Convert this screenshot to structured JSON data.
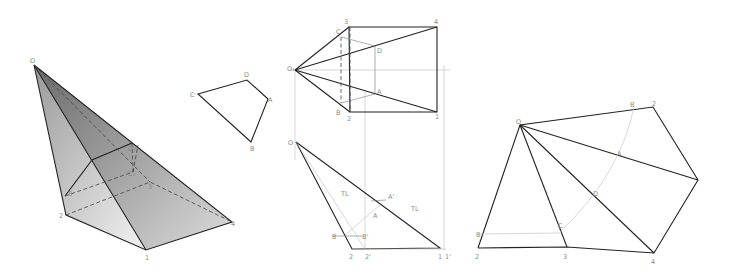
{
  "figure": {
    "type": "descriptive-geometry",
    "panels": [
      {
        "id": "pictorial",
        "description": "Shaded pictorial view of oblique pyramid with truncating section"
      },
      {
        "id": "section-true-shape",
        "description": "True shape of section A B C D"
      },
      {
        "id": "orthographic",
        "description": "Top and front views with true-length construction"
      },
      {
        "id": "development",
        "description": "Development of lateral surface"
      }
    ]
  },
  "labels": {
    "pictorial": {
      "O": "O",
      "D1": "D₁",
      "C1": "C₁",
      "B": "B",
      "n2": "2",
      "n3": "3",
      "n4": "4",
      "n1": "1"
    },
    "section": {
      "C": "C",
      "D": "D",
      "A": "A",
      "B": "B"
    },
    "top_view": {
      "O1": "O₁",
      "n3": "3",
      "n4": "4",
      "C": "C",
      "D": "D",
      "A": "A",
      "B": "B",
      "n2": "2",
      "n1": "1"
    },
    "front_view": {
      "O": "O",
      "TL1": "TL",
      "TL2": "TL",
      "A_prime": "A'",
      "A": "A",
      "B": "B",
      "B_prime": "B'",
      "n2": "2",
      "n2p": "2'",
      "n1": "1",
      "n1p": "1'"
    },
    "development": {
      "O": "O",
      "B_top": "B",
      "n2_top": "2",
      "A": "A",
      "D": "D",
      "C": "C",
      "B_left": "B",
      "n2": "2",
      "n3": "3",
      "n4": "4"
    }
  },
  "colors": {
    "edge": "#222222",
    "construction": "#bdbdbd",
    "label": "#8a8a8a"
  }
}
